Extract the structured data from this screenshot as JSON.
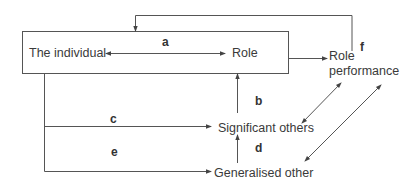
{
  "diagram": {
    "nodes": {
      "individual": "The individual",
      "role": "Role",
      "role_performance_line1": "Role",
      "role_performance_line2": "performance",
      "significant_others": "Significant others",
      "generalised_other": "Generalised other"
    },
    "edge_labels": {
      "a": "a",
      "b": "b",
      "c": "c",
      "d": "d",
      "e": "e",
      "f": "f"
    },
    "edges": [
      {
        "label": "a",
        "from": "The individual",
        "to": "Role",
        "direction": "bidirectional"
      },
      {
        "label": "b",
        "from": "Significant others",
        "to": "Role"
      },
      {
        "label": "c",
        "from": "The individual",
        "to": "Significant others"
      },
      {
        "label": "d",
        "from": "Generalised other",
        "to": "Significant others"
      },
      {
        "label": "e",
        "from": "The individual",
        "to": "Generalised other"
      },
      {
        "label": "f",
        "from": "Role performance",
        "to": "Significant others / Generalised other",
        "direction": "bidirectional"
      },
      {
        "label": "",
        "from": "Role (box)",
        "to": "Role performance"
      },
      {
        "label": "",
        "from": "Role performance",
        "to": "The individual (box)",
        "type": "feedback"
      }
    ],
    "colors": {
      "line": "#555555",
      "text": "#3a3a3a"
    }
  }
}
